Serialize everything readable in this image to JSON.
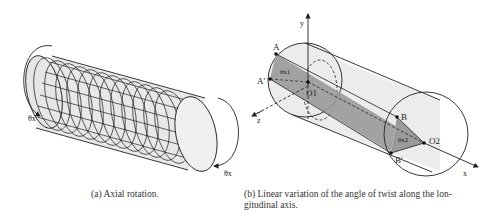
{
  "figure_a": {
    "caption": "(a) Axial rotation.",
    "labels": {
      "theta_left": "θx",
      "theta_right": "θx"
    }
  },
  "figure_b": {
    "caption_line1": "(b) Linear variation of the angle of twist along the lon-",
    "caption_line2": "gitudinal axis.",
    "labels": {
      "y_axis": "y",
      "z_axis": "z",
      "x_axis": "x",
      "A": "A",
      "A_prime": "A'",
      "O1": "O1",
      "B": "B",
      "B_prime": "B'",
      "O2": "O2",
      "theta_x1": "θx1",
      "theta_x2": "θx2"
    }
  },
  "colors": {
    "cylinder_fill": "#ececec",
    "plane_fill": "#9a9a9a",
    "line": "#222222"
  }
}
